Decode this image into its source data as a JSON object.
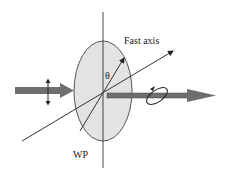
{
  "diagram": {
    "labels": {
      "fast_axis": "Fast axis",
      "theta": "θ",
      "waveplate": "WP"
    },
    "colors": {
      "waveplate_fill": "#e3e3e3",
      "waveplate_stroke": "#555555",
      "beam": "#6e6e6e",
      "line": "#333333"
    },
    "elements": [
      {
        "id": "input-beam",
        "desc": "Linearly polarized input beam (vertical double arrow)"
      },
      {
        "id": "waveplate",
        "desc": "Wave plate ellipse"
      },
      {
        "id": "fast-axis",
        "desc": "Fast axis direction at angle θ from vertical"
      },
      {
        "id": "output-beam",
        "desc": "Output beam with elliptical polarization"
      }
    ]
  }
}
